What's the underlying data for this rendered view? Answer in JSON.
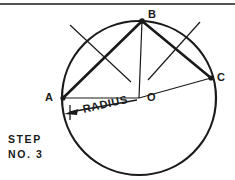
{
  "figure": {
    "caption_lines": [
      "STEP",
      "NO. 3"
    ],
    "step_number": "3",
    "background_color": "#ffffff",
    "ink_color": "#1a1a1a",
    "top_rule": {
      "name": "top-border-rule",
      "y": 4,
      "x1": 0,
      "x2": 235,
      "width": 1.4
    },
    "circle": {
      "label": "construction-circle",
      "cx": 139,
      "cy": 98,
      "r": 77,
      "stroke_width": 2.2
    },
    "points": [
      {
        "id": "A",
        "label": "A",
        "x": 63,
        "y": 98,
        "marker_r": 2.6,
        "label_x": 45,
        "label_y": 92
      },
      {
        "id": "B",
        "label": "B",
        "x": 142,
        "y": 21,
        "marker_r": 2.8,
        "label_x": 148,
        "label_y": 9
      },
      {
        "id": "C",
        "label": "C",
        "x": 211,
        "y": 78,
        "marker_r": 2.6,
        "label_x": 217,
        "label_y": 72
      },
      {
        "id": "O",
        "label": "O",
        "x": 139,
        "y": 98,
        "marker_r": 0,
        "label_x": 147,
        "label_y": 92
      }
    ],
    "chords": [
      {
        "name": "chord-A-B",
        "x1": 63,
        "y1": 98,
        "x2": 142,
        "y2": 21,
        "width": 2.6
      },
      {
        "name": "chord-B-C",
        "x1": 142,
        "y1": 21,
        "x2": 211,
        "y2": 78,
        "width": 2.6
      }
    ],
    "radii": [
      {
        "name": "radius-O-A",
        "x1": 139,
        "y1": 98,
        "x2": 63,
        "y2": 98,
        "width": 1.2
      },
      {
        "name": "radius-O-B",
        "x1": 139,
        "y1": 98,
        "x2": 142,
        "y2": 21,
        "width": 1.2
      },
      {
        "name": "radius-O-C",
        "x1": 139,
        "y1": 98,
        "x2": 211,
        "y2": 78,
        "width": 1.2
      }
    ],
    "construction_lines": [
      {
        "name": "arc-line-left",
        "x1": 70,
        "y1": 25,
        "x2": 131,
        "y2": 82,
        "width": 1.2
      },
      {
        "name": "arc-line-right",
        "x1": 200,
        "y1": 22,
        "x2": 148,
        "y2": 80,
        "width": 1.2
      }
    ],
    "radius_callout": {
      "label": "RADIUS",
      "rotation_deg": -13,
      "leader": {
        "x1": 70,
        "y1": 112,
        "x2": 137,
        "y2": 100,
        "width": 1.3
      },
      "arrow_tip": {
        "x": 64,
        "y": 114
      },
      "arrow_size": 9,
      "tick": {
        "x1": 70,
        "y1": 105,
        "x2": 70,
        "y2": 120,
        "width": 1.3
      }
    }
  }
}
